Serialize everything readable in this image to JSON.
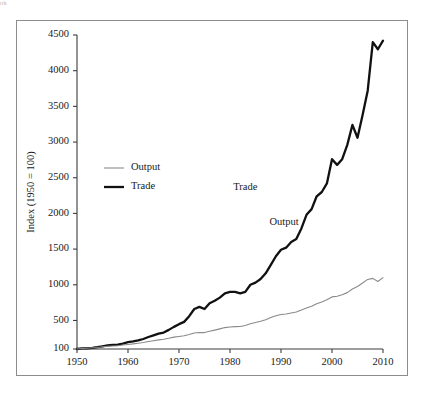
{
  "figure": {
    "corner_mark": "nk",
    "background": "#ffffff",
    "frame_border_color": "#8c8c8c"
  },
  "chart_data": {
    "type": "line",
    "title": "",
    "subtitle": "",
    "xlabel": "",
    "ylabel": "Index (1950 = 100)",
    "xlim": [
      1950,
      2010
    ],
    "ylim": [
      100,
      4500
    ],
    "grid": false,
    "legend_position": "upper-left-inside",
    "xticks": [
      1950,
      1960,
      1970,
      1980,
      1990,
      2000,
      2010
    ],
    "xtick_labels": [
      "1950",
      "1960",
      "1970",
      "1980",
      "1990",
      "2000",
      "2010"
    ],
    "yticks": [
      100,
      500,
      1000,
      1500,
      2000,
      2500,
      3000,
      3500,
      4000,
      4500
    ],
    "ytick_labels": [
      "100",
      "500",
      "1000",
      "1500",
      "2000",
      "2500",
      "3000",
      "3500",
      "4000",
      "4500"
    ],
    "annotations": [
      {
        "text": "Trade",
        "x": 1983.0,
        "y": 2330
      },
      {
        "text": "Output",
        "x": 1990.6,
        "y": 1840
      }
    ],
    "legend": [
      {
        "name": "Output",
        "color": "#8a8a8a",
        "width": 1.1
      },
      {
        "name": "Trade",
        "color": "#111111",
        "width": 2.3
      }
    ],
    "x": [
      1950,
      1951,
      1952,
      1953,
      1954,
      1955,
      1956,
      1957,
      1958,
      1959,
      1960,
      1961,
      1962,
      1963,
      1964,
      1965,
      1966,
      1967,
      1968,
      1969,
      1970,
      1971,
      1972,
      1973,
      1974,
      1975,
      1976,
      1977,
      1978,
      1979,
      1980,
      1981,
      1982,
      1983,
      1984,
      1985,
      1986,
      1987,
      1988,
      1989,
      1990,
      1991,
      1992,
      1993,
      1994,
      1995,
      1996,
      1997,
      1998,
      1999,
      2000,
      2001,
      2002,
      2003,
      2004,
      2005,
      2006,
      2007,
      2008,
      2009,
      2010
    ],
    "series": [
      {
        "name": "Trade",
        "color": "#111111",
        "width": 2.3,
        "values": [
          100,
          108,
          110,
          116,
          125,
          138,
          150,
          158,
          160,
          176,
          195,
          206,
          220,
          240,
          268,
          292,
          316,
          330,
          368,
          410,
          448,
          480,
          560,
          660,
          690,
          660,
          740,
          775,
          820,
          880,
          900,
          900,
          880,
          900,
          1000,
          1030,
          1080,
          1160,
          1280,
          1400,
          1490,
          1520,
          1600,
          1640,
          1790,
          1980,
          2060,
          2240,
          2300,
          2420,
          2760,
          2680,
          2760,
          2960,
          3240,
          3060,
          3380,
          3720,
          4400,
          4300,
          4420
        ]
      },
      {
        "name": "Output",
        "color": "#8a8a8a",
        "width": 1.1,
        "values": [
          100,
          106,
          110,
          117,
          121,
          131,
          138,
          143,
          145,
          155,
          164,
          172,
          181,
          191,
          204,
          216,
          228,
          236,
          250,
          266,
          276,
          286,
          303,
          325,
          332,
          330,
          349,
          365,
          382,
          400,
          408,
          414,
          416,
          430,
          454,
          472,
          490,
          510,
          540,
          565,
          583,
          590,
          605,
          618,
          645,
          675,
          700,
          735,
          760,
          790,
          830,
          840,
          860,
          890,
          940,
          975,
          1025,
          1075,
          1090,
          1045,
          1100
        ]
      }
    ]
  }
}
